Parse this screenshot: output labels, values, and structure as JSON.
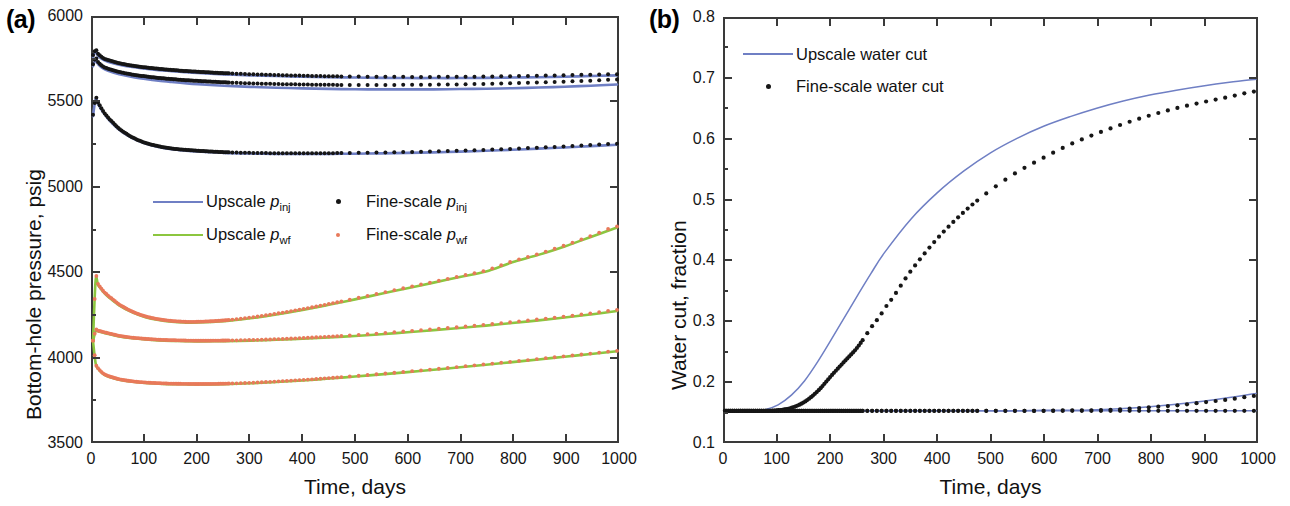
{
  "figure": {
    "panel_a_tag": "(a)",
    "panel_b_tag": "(b)"
  },
  "panel_a": {
    "tag": "(a)",
    "xlabel": "Time, days",
    "ylabel": "Bottom-hole pressure, psig",
    "xticks": [
      "0",
      "100",
      "200",
      "300",
      "400",
      "500",
      "600",
      "700",
      "800",
      "900",
      "1000"
    ],
    "yticks": [
      "3500",
      "4000",
      "4500",
      "5000",
      "5500",
      "6000"
    ],
    "legend": [
      {
        "key": "line",
        "color": "#6f7fc4",
        "label_plain": "Upscale p",
        "sub": "inj"
      },
      {
        "key": "marker",
        "color": "#161616",
        "label_plain": "Fine-scale p",
        "sub": "inj"
      },
      {
        "key": "line",
        "color": "#8cc63f",
        "label_plain": "Upscale p",
        "sub": "wf"
      },
      {
        "key": "marker",
        "color": "#e8795a",
        "label_plain": "Fine-scale p",
        "sub": "wf"
      }
    ]
  },
  "panel_b": {
    "tag": "(b)",
    "xlabel": "Time, days",
    "ylabel": "Water cut, fraction",
    "xticks": [
      "0",
      "100",
      "200",
      "300",
      "400",
      "500",
      "600",
      "700",
      "800",
      "900",
      "1000"
    ],
    "yticks": [
      "0.1",
      "0.2",
      "0.3",
      "0.4",
      "0.5",
      "0.6",
      "0.7",
      "0.8"
    ],
    "legend": [
      {
        "key": "line",
        "color": "#6f7fc4",
        "label_plain": "Upscale water cut",
        "sub": ""
      },
      {
        "key": "marker",
        "color": "#161616",
        "label_plain": "Fine-scale water cut",
        "sub": ""
      }
    ]
  },
  "chart_data": [
    {
      "type": "line",
      "panel": "(a)",
      "title": "",
      "xlabel": "Time, days",
      "ylabel": "Bottom-hole pressure, psig",
      "xlim": [
        0,
        1000
      ],
      "ylim": [
        3500,
        6000
      ],
      "xticks": [
        0,
        100,
        200,
        300,
        400,
        500,
        600,
        700,
        800,
        900,
        1000
      ],
      "yticks": [
        3500,
        4000,
        4500,
        5000,
        5500,
        6000
      ],
      "grid": false,
      "legend_position": "center-left",
      "x": [
        0,
        5,
        10,
        20,
        30,
        50,
        75,
        100,
        125,
        150,
        175,
        200,
        250,
        300,
        350,
        400,
        450,
        500,
        550,
        600,
        650,
        700,
        750,
        800,
        850,
        900,
        950,
        1000
      ],
      "series": [
        {
          "name": "Upscale p_inj (well 1)",
          "style": "line",
          "color": "#6f7fc4",
          "values": [
            5770,
            5800,
            5775,
            5752,
            5740,
            5724,
            5710,
            5700,
            5692,
            5686,
            5680,
            5675,
            5667,
            5661,
            5657,
            5653,
            5650,
            5648,
            5646,
            5645,
            5645,
            5645,
            5646,
            5648,
            5650,
            5653,
            5657,
            5661
          ]
        },
        {
          "name": "Fine-scale p_inj (well 1)",
          "style": "markers",
          "color": "#161616",
          "values": [
            5782,
            5812,
            5787,
            5762,
            5750,
            5733,
            5718,
            5708,
            5700,
            5693,
            5687,
            5682,
            5674,
            5668,
            5663,
            5659,
            5656,
            5654,
            5653,
            5652,
            5652,
            5653,
            5654,
            5656,
            5659,
            5662,
            5665,
            5668
          ]
        },
        {
          "name": "Upscale p_inj (well 2)",
          "style": "line",
          "color": "#6f7fc4",
          "values": [
            5715,
            5752,
            5726,
            5700,
            5686,
            5668,
            5652,
            5640,
            5630,
            5622,
            5615,
            5609,
            5600,
            5593,
            5588,
            5584,
            5581,
            5579,
            5578,
            5578,
            5578,
            5580,
            5582,
            5585,
            5589,
            5594,
            5600,
            5607
          ]
        },
        {
          "name": "Fine-scale p_inj (well 2)",
          "style": "markers",
          "color": "#161616",
          "values": [
            5726,
            5763,
            5737,
            5712,
            5699,
            5681,
            5666,
            5655,
            5646,
            5639,
            5633,
            5628,
            5620,
            5614,
            5610,
            5607,
            5605,
            5604,
            5604,
            5605,
            5606,
            5608,
            5611,
            5615,
            5619,
            5624,
            5630,
            5637
          ]
        },
        {
          "name": "Upscale p_inj (well 3)",
          "style": "line",
          "color": "#6f7fc4",
          "values": [
            5420,
            5520,
            5490,
            5440,
            5400,
            5340,
            5290,
            5258,
            5238,
            5225,
            5217,
            5211,
            5203,
            5199,
            5197,
            5196,
            5197,
            5198,
            5200,
            5203,
            5206,
            5210,
            5215,
            5221,
            5228,
            5235,
            5243,
            5251
          ]
        },
        {
          "name": "Fine-scale p_inj (well 3)",
          "style": "markers",
          "color": "#161616",
          "values": [
            5428,
            5528,
            5497,
            5446,
            5406,
            5345,
            5295,
            5262,
            5242,
            5229,
            5221,
            5215,
            5207,
            5203,
            5201,
            5200,
            5201,
            5203,
            5205,
            5208,
            5211,
            5216,
            5221,
            5227,
            5234,
            5241,
            5249,
            5257
          ]
        },
        {
          "name": "Upscale p_wf (well 1)",
          "style": "line",
          "color": "#8cc63f",
          "values": [
            4090,
            4450,
            4420,
            4380,
            4350,
            4302,
            4260,
            4232,
            4215,
            4205,
            4200,
            4200,
            4208,
            4225,
            4248,
            4275,
            4305,
            4337,
            4370,
            4403,
            4436,
            4469,
            4502,
            4556,
            4600,
            4650,
            4706,
            4762
          ]
        },
        {
          "name": "Fine-scale p_wf (well 1)",
          "style": "markers",
          "color": "#e8795a",
          "values": [
            4095,
            4455,
            4425,
            4385,
            4355,
            4307,
            4265,
            4237,
            4220,
            4210,
            4205,
            4205,
            4213,
            4230,
            4253,
            4280,
            4310,
            4342,
            4375,
            4408,
            4441,
            4474,
            4508,
            4562,
            4606,
            4656,
            4712,
            4768
          ]
        },
        {
          "name": "Upscale p_wf (well 2)",
          "style": "line",
          "color": "#8cc63f",
          "values": [
            4090,
            4150,
            4148,
            4140,
            4132,
            4118,
            4107,
            4100,
            4095,
            4092,
            4090,
            4089,
            4090,
            4093,
            4098,
            4104,
            4112,
            4121,
            4131,
            4143,
            4155,
            4168,
            4182,
            4197,
            4213,
            4230,
            4248,
            4268
          ]
        },
        {
          "name": "Fine-scale p_wf (well 2)",
          "style": "markers",
          "color": "#e8795a",
          "values": [
            4092,
            4155,
            4152,
            4144,
            4136,
            4122,
            4111,
            4104,
            4099,
            4096,
            4094,
            4093,
            4094,
            4097,
            4102,
            4109,
            4117,
            4126,
            4137,
            4149,
            4161,
            4174,
            4188,
            4203,
            4219,
            4236,
            4255,
            4275
          ]
        },
        {
          "name": "Upscale p_wf (well 3)",
          "style": "line",
          "color": "#8cc63f",
          "values": [
            4090,
            3960,
            3925,
            3895,
            3880,
            3862,
            3850,
            3843,
            3839,
            3836,
            3835,
            3834,
            3836,
            3841,
            3849,
            3858,
            3869,
            3881,
            3894,
            3907,
            3921,
            3936,
            3951,
            3966,
            3982,
            3998,
            4014,
            4030
          ]
        },
        {
          "name": "Fine-scale p_wf (well 3)",
          "style": "markers",
          "color": "#e8795a",
          "values": [
            4092,
            3962,
            3928,
            3898,
            3883,
            3865,
            3853,
            3846,
            3842,
            3839,
            3838,
            3837,
            3839,
            3844,
            3852,
            3861,
            3872,
            3884,
            3897,
            3910,
            3924,
            3939,
            3954,
            3969,
            3985,
            4001,
            4017,
            4033
          ]
        }
      ]
    },
    {
      "type": "line",
      "panel": "(b)",
      "title": "",
      "xlabel": "Time, days",
      "ylabel": "Water cut, fraction",
      "xlim": [
        0,
        1000
      ],
      "ylim": [
        0.1,
        0.8
      ],
      "xticks": [
        0,
        100,
        200,
        300,
        400,
        500,
        600,
        700,
        800,
        900,
        1000
      ],
      "yticks": [
        0.1,
        0.2,
        0.3,
        0.4,
        0.5,
        0.6,
        0.7,
        0.8
      ],
      "grid": false,
      "legend_position": "top-left",
      "x": [
        0,
        25,
        50,
        75,
        100,
        125,
        150,
        175,
        200,
        225,
        250,
        275,
        300,
        350,
        400,
        450,
        500,
        550,
        600,
        650,
        700,
        750,
        800,
        850,
        900,
        950,
        1000
      ],
      "series": [
        {
          "name": "Upscale water cut (well 1)",
          "style": "line",
          "color": "#6f7fc4",
          "values": [
            0.15,
            0.15,
            0.15,
            0.152,
            0.16,
            0.176,
            0.2,
            0.232,
            0.268,
            0.305,
            0.342,
            0.378,
            0.412,
            0.468,
            0.512,
            0.548,
            0.578,
            0.602,
            0.622,
            0.638,
            0.652,
            0.664,
            0.674,
            0.682,
            0.689,
            0.695,
            0.7
          ]
        },
        {
          "name": "Fine-scale water cut (well 1)",
          "style": "markers",
          "color": "#161616",
          "values": [
            0.15,
            0.15,
            0.15,
            0.15,
            0.151,
            0.155,
            0.165,
            0.183,
            0.208,
            0.232,
            0.256,
            0.288,
            0.32,
            0.382,
            0.436,
            0.48,
            0.516,
            0.546,
            0.57,
            0.592,
            0.61,
            0.626,
            0.64,
            0.652,
            0.662,
            0.671,
            0.68
          ]
        },
        {
          "name": "Upscale water cut (well 2)",
          "style": "line",
          "color": "#6f7fc4",
          "values": [
            0.15,
            0.15,
            0.15,
            0.15,
            0.15,
            0.15,
            0.15,
            0.15,
            0.15,
            0.15,
            0.15,
            0.15,
            0.15,
            0.15,
            0.15,
            0.15,
            0.15,
            0.15,
            0.151,
            0.151,
            0.152,
            0.154,
            0.157,
            0.161,
            0.166,
            0.172,
            0.179
          ]
        },
        {
          "name": "Fine-scale water cut (well 2)",
          "style": "markers",
          "color": "#161616",
          "values": [
            0.15,
            0.15,
            0.15,
            0.15,
            0.15,
            0.15,
            0.15,
            0.15,
            0.15,
            0.15,
            0.15,
            0.15,
            0.15,
            0.15,
            0.15,
            0.15,
            0.15,
            0.15,
            0.15,
            0.151,
            0.151,
            0.153,
            0.156,
            0.159,
            0.164,
            0.169,
            0.175
          ]
        },
        {
          "name": "Upscale water cut (well 3)",
          "style": "line",
          "color": "#6f7fc4",
          "values": [
            0.15,
            0.15,
            0.15,
            0.15,
            0.15,
            0.15,
            0.15,
            0.15,
            0.15,
            0.15,
            0.15,
            0.15,
            0.15,
            0.15,
            0.15,
            0.15,
            0.15,
            0.15,
            0.15,
            0.15,
            0.15,
            0.15,
            0.15,
            0.15,
            0.15,
            0.15,
            0.15
          ]
        },
        {
          "name": "Fine-scale water cut (well 3)",
          "style": "markers",
          "color": "#161616",
          "values": [
            0.15,
            0.15,
            0.15,
            0.15,
            0.15,
            0.15,
            0.15,
            0.15,
            0.15,
            0.15,
            0.15,
            0.15,
            0.15,
            0.15,
            0.15,
            0.15,
            0.15,
            0.15,
            0.15,
            0.15,
            0.15,
            0.15,
            0.15,
            0.15,
            0.15,
            0.15,
            0.15
          ]
        }
      ]
    }
  ]
}
